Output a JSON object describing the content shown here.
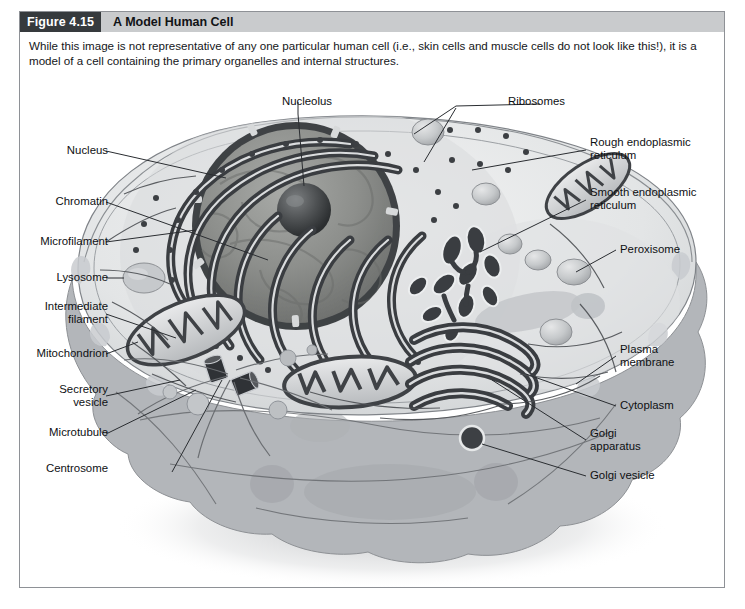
{
  "figure": {
    "number": "Figure 4.15",
    "title": "A Model Human Cell",
    "caption": "While this image is not representative of any one particular human cell (i.e., skin cells and muscle cells do not look like this!), it is a model of a cell containing the primary organelles and internal structures."
  },
  "colors": {
    "header_number_bg": "#363a3d",
    "header_title_bg": "#c9cbcd",
    "frame_border": "#8e9196",
    "leader_line": "#2a2d31",
    "cytoplasm_light": "#e8e9ea",
    "cytoplasm_shadow": "#a9acb0",
    "nucleus_dark": "#4f5356",
    "er_dark": "#3c4044",
    "page_bg": "#ffffff"
  },
  "labels": {
    "nucleolus": "Nucleolus",
    "ribosomes": "Ribosomes",
    "nucleus": "Nucleus",
    "chromatin": "Chromatin",
    "microfilament": "Microfilament",
    "lysosome": "Lysosome",
    "intermediate_filament": "Intermediate\nfilament",
    "mitochondrion": "Mitochondrion",
    "secretory_vesicle": "Secretory\nvesicle",
    "microtubule": "Microtubule",
    "centrosome": "Centrosome",
    "rough_er": "Rough endoplasmic\nreticulum",
    "smooth_er": "Smooth endoplasmic\nreticulum",
    "peroxisome": "Peroxisome",
    "plasma_membrane": "Plasma\nmembrane",
    "cytoplasm": "Cytoplasm",
    "golgi_apparatus": "Golgi\napparatus",
    "golgi_vesicle": "Golgi vesicle"
  }
}
